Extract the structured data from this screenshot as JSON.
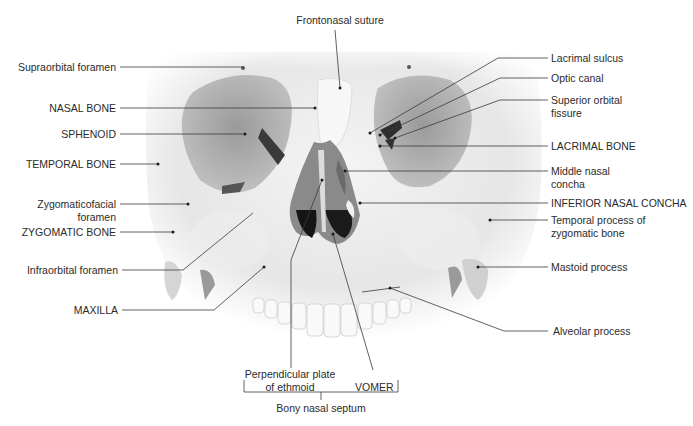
{
  "figure": {
    "caption_faint": "Figure"
  },
  "labels": {
    "top": {
      "frontonasal_suture": "Frontonasal suture"
    },
    "left": [
      {
        "id": "supraorbital-foramen",
        "line1": "Supraorbital foramen"
      },
      {
        "id": "nasal-bone",
        "line1": "NASAL BONE"
      },
      {
        "id": "sphenoid",
        "line1": "SPHENOID"
      },
      {
        "id": "temporal-bone",
        "line1": "TEMPORAL BONE"
      },
      {
        "id": "zygomaticofacial-foramen",
        "line1": "Zygomaticofacial",
        "line2": "foramen"
      },
      {
        "id": "zygomatic-bone",
        "line1": "ZYGOMATIC BONE"
      },
      {
        "id": "infraorbital-foramen",
        "line1": "Infraorbital foramen"
      },
      {
        "id": "maxilla",
        "line1": "MAXILLA"
      }
    ],
    "right": [
      {
        "id": "lacrimal-sulcus",
        "line1": "Lacrimal sulcus"
      },
      {
        "id": "optic-canal",
        "line1": "Optic canal"
      },
      {
        "id": "superior-orbital-fissure",
        "line1": "Superior orbital",
        "line2": "fissure"
      },
      {
        "id": "lacrimal-bone",
        "line1": "LACRIMAL BONE"
      },
      {
        "id": "middle-nasal-concha",
        "line1": "Middle nasal",
        "line2": "concha"
      },
      {
        "id": "inferior-nasal-concha",
        "line1": "INFERIOR NASAL CONCHA"
      },
      {
        "id": "temporal-process",
        "line1": "Temporal process of",
        "line2": "zygomatic bone"
      },
      {
        "id": "mastoid-process",
        "line1": "Mastoid process"
      },
      {
        "id": "alveolar-process",
        "line1": "Alveolar process"
      }
    ],
    "bottom": {
      "perpendicular_plate_line1": "Perpendicular plate",
      "perpendicular_plate_line2": "of ethmoid",
      "vomer": "VOMER",
      "bony_nasal_septum": "Bony nasal septum"
    }
  }
}
